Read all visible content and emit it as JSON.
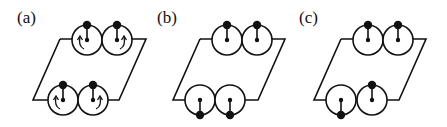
{
  "figure": {
    "panels": [
      {
        "label": "(a)",
        "label_pos": [
          17,
          23
        ],
        "frame": {
          "top": [
            60,
            39,
            146,
            39
          ],
          "bottom": [
            33,
            100,
            119,
            100
          ]
        },
        "circles": [
          {
            "cx": 87,
            "cy": 40,
            "r": 15,
            "pin": "up",
            "rotation": "ccw"
          },
          {
            "cx": 117,
            "cy": 40,
            "r": 15,
            "pin": "up",
            "rotation": "cw"
          },
          {
            "cx": 63,
            "cy": 100,
            "r": 15,
            "pin": "up",
            "rotation": "ccw"
          },
          {
            "cx": 93,
            "cy": 100,
            "r": 15,
            "pin": "up",
            "rotation": "cw"
          }
        ]
      },
      {
        "label": "(b)",
        "label_pos": [
          157,
          23
        ],
        "frame": {
          "top": [
            200,
            39,
            285,
            39
          ],
          "bottom": [
            173,
            100,
            258,
            100
          ]
        },
        "circles": [
          {
            "cx": 227,
            "cy": 40,
            "r": 15,
            "pin": "up",
            "rotation": "none"
          },
          {
            "cx": 257,
            "cy": 40,
            "r": 15,
            "pin": "up",
            "rotation": "none"
          },
          {
            "cx": 200,
            "cy": 100,
            "r": 15,
            "pin": "down",
            "rotation": "none"
          },
          {
            "cx": 230,
            "cy": 100,
            "r": 15,
            "pin": "down",
            "rotation": "none"
          }
        ]
      },
      {
        "label": "(c)",
        "label_pos": [
          299,
          23
        ],
        "frame": {
          "top": [
            341,
            39,
            426,
            39
          ],
          "bottom": [
            314,
            100,
            399,
            100
          ]
        },
        "circles": [
          {
            "cx": 368,
            "cy": 40,
            "r": 15,
            "pin": "up",
            "rotation": "none"
          },
          {
            "cx": 398,
            "cy": 40,
            "r": 15,
            "pin": "up",
            "rotation": "none"
          },
          {
            "cx": 341,
            "cy": 100,
            "r": 15,
            "pin": "down",
            "rotation": "none"
          },
          {
            "cx": 372,
            "cy": 100,
            "r": 15,
            "pin": "up",
            "rotation": "none"
          }
        ]
      }
    ]
  }
}
